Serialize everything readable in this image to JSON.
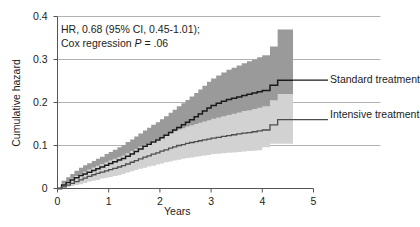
{
  "chart_data": {
    "type": "line",
    "title": "",
    "xlabel": "Years",
    "ylabel": "Cumulative hazard",
    "xlim": [
      0,
      5
    ],
    "ylim": [
      0,
      0.4
    ],
    "xticks": [
      "0",
      "1",
      "2",
      "3",
      "4",
      "5"
    ],
    "xtick_values": [
      0,
      1,
      2,
      3,
      4,
      5
    ],
    "yticks": [
      "0",
      "0.1",
      "0.2",
      "0.3",
      "0.4"
    ],
    "ytick_values": [
      0,
      0.1,
      0.2,
      0.3,
      0.4
    ],
    "grid": "horizontal",
    "legend_position": "right-inline",
    "annotation_lines": [
      "HR, 0.68 (95% CI, 0.45-1.01);",
      "Cox regression P = .06"
    ],
    "annotation_stats": {
      "hazard_ratio": 0.68,
      "ci_level": "95%",
      "ci_low": 0.45,
      "ci_high": 1.01,
      "p_value": ".06",
      "test": "Cox regression"
    },
    "colors": {
      "standard_line": "#1a1a1a",
      "intensive_line": "#4d4d4d",
      "standard_band": "#9a9a9a",
      "intensive_band": "#d2d2d2",
      "axis": "#555555",
      "grid": "#9e9e9e",
      "text": "#1c1c1c"
    },
    "series": [
      {
        "name": "Standard treatment",
        "label": "Standard treatment",
        "x": [
          0,
          0.08,
          0.17,
          0.25,
          0.33,
          0.42,
          0.5,
          0.58,
          0.67,
          0.75,
          0.83,
          0.92,
          1.0,
          1.08,
          1.17,
          1.25,
          1.33,
          1.42,
          1.5,
          1.58,
          1.67,
          1.75,
          1.83,
          1.92,
          2.0,
          2.08,
          2.17,
          2.25,
          2.33,
          2.42,
          2.5,
          2.58,
          2.67,
          2.75,
          2.83,
          2.92,
          3.0,
          3.1,
          3.2,
          3.3,
          3.4,
          3.5,
          3.6,
          3.7,
          3.8,
          3.9,
          4.0,
          4.15,
          4.3,
          4.45,
          4.6
        ],
        "values": [
          0,
          0.008,
          0.014,
          0.02,
          0.025,
          0.03,
          0.034,
          0.038,
          0.042,
          0.046,
          0.05,
          0.054,
          0.058,
          0.062,
          0.066,
          0.07,
          0.075,
          0.08,
          0.086,
          0.092,
          0.098,
          0.103,
          0.108,
          0.113,
          0.118,
          0.124,
          0.13,
          0.136,
          0.142,
          0.148,
          0.154,
          0.16,
          0.167,
          0.173,
          0.18,
          0.187,
          0.193,
          0.198,
          0.203,
          0.207,
          0.21,
          0.213,
          0.216,
          0.219,
          0.222,
          0.225,
          0.228,
          0.24,
          0.252,
          0.252,
          0.252
        ],
        "ci_upper": [
          0,
          0.018,
          0.026,
          0.034,
          0.041,
          0.048,
          0.054,
          0.059,
          0.064,
          0.069,
          0.074,
          0.08,
          0.085,
          0.09,
          0.096,
          0.101,
          0.108,
          0.114,
          0.121,
          0.128,
          0.135,
          0.141,
          0.148,
          0.154,
          0.161,
          0.168,
          0.176,
          0.183,
          0.191,
          0.198,
          0.206,
          0.214,
          0.222,
          0.23,
          0.239,
          0.248,
          0.256,
          0.263,
          0.27,
          0.276,
          0.281,
          0.286,
          0.291,
          0.296,
          0.3,
          0.305,
          0.31,
          0.33,
          0.37,
          0.37,
          0.37
        ],
        "ci_lower": [
          0,
          0.002,
          0.005,
          0.008,
          0.012,
          0.016,
          0.019,
          0.022,
          0.025,
          0.028,
          0.031,
          0.034,
          0.037,
          0.04,
          0.043,
          0.046,
          0.05,
          0.054,
          0.058,
          0.062,
          0.066,
          0.07,
          0.074,
          0.078,
          0.082,
          0.086,
          0.091,
          0.095,
          0.1,
          0.105,
          0.11,
          0.114,
          0.119,
          0.124,
          0.129,
          0.134,
          0.139,
          0.143,
          0.147,
          0.15,
          0.153,
          0.155,
          0.157,
          0.159,
          0.161,
          0.163,
          0.165,
          0.172,
          0.18,
          0.18,
          0.18
        ]
      },
      {
        "name": "Intensive treatment",
        "label": "Intensive treatment",
        "x": [
          0,
          0.08,
          0.17,
          0.25,
          0.33,
          0.42,
          0.5,
          0.58,
          0.67,
          0.75,
          0.83,
          0.92,
          1.0,
          1.08,
          1.17,
          1.25,
          1.33,
          1.42,
          1.5,
          1.58,
          1.67,
          1.75,
          1.83,
          1.92,
          2.0,
          2.08,
          2.17,
          2.25,
          2.33,
          2.42,
          2.5,
          2.58,
          2.67,
          2.75,
          2.83,
          2.92,
          3.0,
          3.1,
          3.2,
          3.3,
          3.4,
          3.5,
          3.6,
          3.7,
          3.8,
          3.9,
          4.0,
          4.15,
          4.3,
          4.45,
          4.6
        ],
        "values": [
          0,
          0.004,
          0.008,
          0.012,
          0.016,
          0.02,
          0.024,
          0.028,
          0.032,
          0.035,
          0.038,
          0.041,
          0.044,
          0.047,
          0.05,
          0.053,
          0.057,
          0.061,
          0.065,
          0.069,
          0.073,
          0.076,
          0.08,
          0.083,
          0.087,
          0.09,
          0.094,
          0.097,
          0.1,
          0.102,
          0.105,
          0.107,
          0.109,
          0.111,
          0.113,
          0.115,
          0.117,
          0.119,
          0.121,
          0.123,
          0.125,
          0.127,
          0.129,
          0.13,
          0.132,
          0.134,
          0.136,
          0.148,
          0.16,
          0.16,
          0.16
        ],
        "ci_upper": [
          0,
          0.011,
          0.017,
          0.023,
          0.029,
          0.034,
          0.039,
          0.044,
          0.049,
          0.053,
          0.057,
          0.061,
          0.065,
          0.069,
          0.073,
          0.077,
          0.082,
          0.087,
          0.092,
          0.097,
          0.102,
          0.106,
          0.111,
          0.115,
          0.12,
          0.124,
          0.129,
          0.133,
          0.137,
          0.14,
          0.144,
          0.147,
          0.15,
          0.153,
          0.156,
          0.159,
          0.162,
          0.165,
          0.168,
          0.171,
          0.174,
          0.177,
          0.18,
          0.182,
          0.185,
          0.188,
          0.191,
          0.205,
          0.22,
          0.22,
          0.22
        ],
        "ci_lower": [
          0,
          0.001,
          0.002,
          0.004,
          0.006,
          0.008,
          0.01,
          0.013,
          0.016,
          0.018,
          0.02,
          0.023,
          0.025,
          0.027,
          0.029,
          0.031,
          0.034,
          0.037,
          0.04,
          0.043,
          0.046,
          0.048,
          0.051,
          0.053,
          0.056,
          0.058,
          0.061,
          0.063,
          0.065,
          0.067,
          0.069,
          0.071,
          0.072,
          0.074,
          0.075,
          0.077,
          0.078,
          0.08,
          0.081,
          0.082,
          0.083,
          0.084,
          0.085,
          0.086,
          0.087,
          0.088,
          0.089,
          0.096,
          0.104,
          0.104,
          0.104
        ]
      }
    ]
  }
}
